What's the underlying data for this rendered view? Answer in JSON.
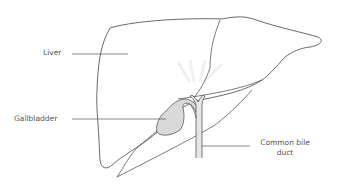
{
  "diagram": {
    "type": "anatomical-illustration",
    "subject": "liver",
    "colors": {
      "outline": "#444444",
      "gallbladder_fill": "#d9d9d9",
      "duct_fill": "#e6e6e6",
      "leader_line": "#555555",
      "label_text": "#555555",
      "watermark": "#eeeeee"
    },
    "labels": [
      {
        "id": "liver",
        "text": "Liver"
      },
      {
        "id": "gallbladder",
        "text": "Gallbladder"
      },
      {
        "id": "common-bile-duct",
        "line1": "Common bile",
        "line2": "duct"
      }
    ]
  }
}
